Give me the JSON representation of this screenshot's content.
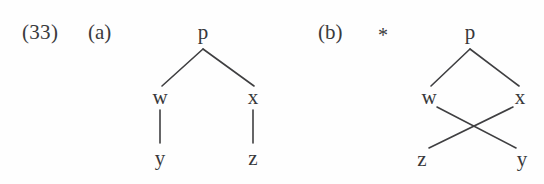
{
  "figure": {
    "example_number": "(33)",
    "background_color": "#fefefe",
    "ink_color": "#3a3a3c"
  },
  "trees": [
    {
      "id": "tree-a",
      "label": "(a)",
      "grammaticality_marker": "",
      "well_formed": true,
      "nodes": {
        "root": "p",
        "left_daughter": "w",
        "right_daughter": "x",
        "left_terminal": "y",
        "right_terminal": "z"
      },
      "description": "non-crossing branches"
    },
    {
      "id": "tree-b",
      "label": "(b)",
      "grammaticality_marker": "*",
      "well_formed": false,
      "nodes": {
        "root": "p",
        "left_daughter": "w",
        "right_daughter": "x",
        "left_terminal": "z",
        "right_terminal": "y"
      },
      "description": "crossing branches"
    }
  ]
}
